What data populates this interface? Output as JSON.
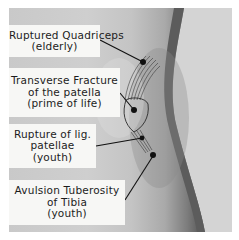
{
  "figure": {
    "background_color": "#ffffff",
    "photo_tone": "#c9c9c9",
    "label_bg": "#f7f7f5",
    "text_color": "#1c1c1c"
  },
  "labels": [
    {
      "lines": [
        "Ruptured Quadriceps",
        "(elderly)"
      ]
    },
    {
      "lines": [
        "Transverse Fracture",
        "of the patella",
        "(prime of life)"
      ]
    },
    {
      "lines": [
        "Rupture of lig.",
        "patellae",
        "(youth)"
      ]
    },
    {
      "lines": [
        "Avulsion Tuberosity",
        "of Tibia",
        "(youth)"
      ]
    }
  ]
}
